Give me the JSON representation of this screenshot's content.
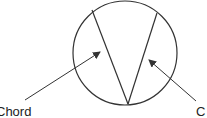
{
  "diagram": {
    "type": "circle-with-chords",
    "labels": {
      "left": "Chord",
      "right": "C"
    },
    "stroke_color": "#333333"
  }
}
